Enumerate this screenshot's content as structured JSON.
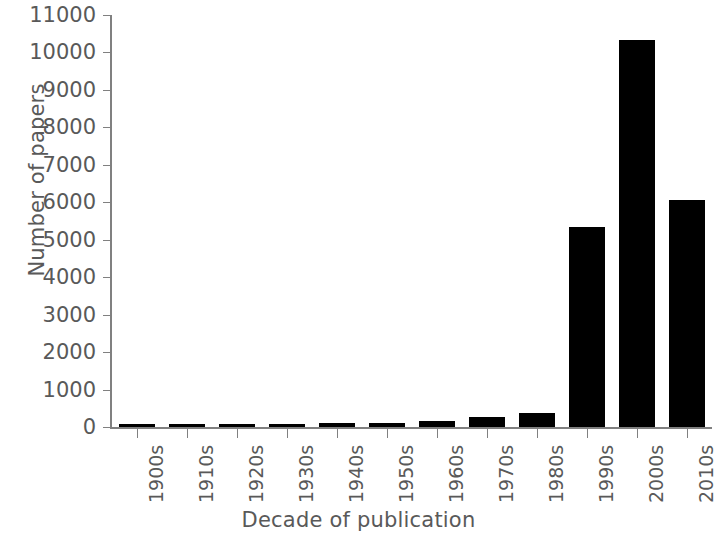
{
  "chart_data": {
    "type": "bar",
    "title": "",
    "xlabel": "Decade of publication",
    "ylabel": "Number of papers",
    "categories": [
      "1900s",
      "1910s",
      "1920s",
      "1930s",
      "1940s",
      "1950s",
      "1960s",
      "1970s",
      "1980s",
      "1990s",
      "2000s",
      "2010s"
    ],
    "values": [
      60,
      70,
      80,
      80,
      100,
      100,
      160,
      265,
      375,
      5340,
      10320,
      6060
    ],
    "ylim": [
      0,
      11000
    ],
    "ytick_labels": [
      "0",
      "1000",
      "2000",
      "3000",
      "4000",
      "5000",
      "6000",
      "7000",
      "8000",
      "9000",
      "10000",
      "11000"
    ],
    "ytick_values": [
      0,
      1000,
      2000,
      3000,
      4000,
      5000,
      6000,
      7000,
      8000,
      9000,
      10000,
      11000
    ],
    "grid": false,
    "legend": false,
    "bar_color": "#000000",
    "axis_color": "#808080",
    "text_color": "#595959"
  }
}
